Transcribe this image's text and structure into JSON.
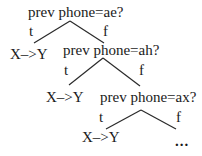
{
  "diagram": {
    "type": "decision-tree",
    "nodes": [
      {
        "question": "prev phone=ae?",
        "true_label": "t",
        "false_label": "f",
        "true_leaf": "X–>Y"
      },
      {
        "question": "prev phone=ah?",
        "true_label": "t",
        "false_label": "f",
        "true_leaf": "X–>Y"
      },
      {
        "question": "prev phone=ax?",
        "true_label": "t",
        "false_label": "f",
        "true_leaf": "X–>Y",
        "false_continuation": "..."
      }
    ]
  }
}
